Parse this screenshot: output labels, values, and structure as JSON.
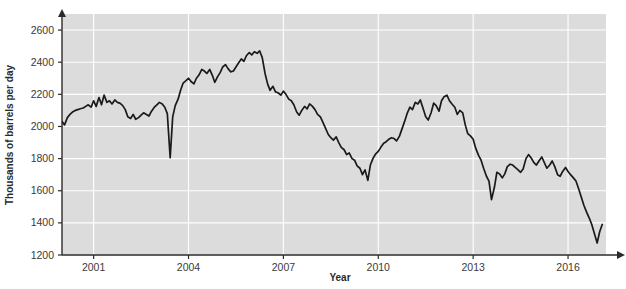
{
  "chart_data": {
    "type": "line",
    "title": "",
    "subtitle": "",
    "xlabel": "Year",
    "ylabel": "Thousands of barrels per day",
    "xlim": [
      2000.0,
      2017.2
    ],
    "ylim": [
      1200,
      2700
    ],
    "y_ticks": [
      1200,
      1400,
      1600,
      1800,
      2000,
      2200,
      2400,
      2600
    ],
    "x_ticks": [
      2001,
      2004,
      2007,
      2010,
      2013,
      2016
    ],
    "grid": "horizontal-and-vertical-white-gridlines",
    "legend": "none",
    "line_color": "#1a1a1a",
    "plot_background": "#dcdcdc",
    "series": [
      {
        "name": "Production",
        "x": [
          2000.0,
          2000.08,
          2000.17,
          2000.25,
          2000.33,
          2000.42,
          2000.5,
          2000.58,
          2000.67,
          2000.75,
          2000.83,
          2000.92,
          2001.0,
          2001.08,
          2001.17,
          2001.25,
          2001.33,
          2001.42,
          2001.5,
          2001.58,
          2001.67,
          2001.75,
          2001.83,
          2001.92,
          2002.0,
          2002.08,
          2002.17,
          2002.25,
          2002.33,
          2002.42,
          2002.5,
          2002.58,
          2002.67,
          2002.75,
          2002.83,
          2002.92,
          2003.0,
          2003.08,
          2003.17,
          2003.25,
          2003.33,
          2003.42,
          2003.5,
          2003.58,
          2003.67,
          2003.75,
          2003.83,
          2003.92,
          2004.0,
          2004.08,
          2004.17,
          2004.25,
          2004.33,
          2004.42,
          2004.5,
          2004.58,
          2004.67,
          2004.75,
          2004.83,
          2004.92,
          2005.0,
          2005.08,
          2005.17,
          2005.25,
          2005.33,
          2005.42,
          2005.5,
          2005.58,
          2005.67,
          2005.75,
          2005.83,
          2005.92,
          2006.0,
          2006.08,
          2006.17,
          2006.25,
          2006.33,
          2006.42,
          2006.5,
          2006.58,
          2006.67,
          2006.75,
          2006.83,
          2006.92,
          2007.0,
          2007.08,
          2007.17,
          2007.25,
          2007.33,
          2007.42,
          2007.5,
          2007.58,
          2007.67,
          2007.75,
          2007.83,
          2007.92,
          2008.0,
          2008.08,
          2008.17,
          2008.25,
          2008.33,
          2008.42,
          2008.5,
          2008.58,
          2008.67,
          2008.75,
          2008.83,
          2008.92,
          2009.0,
          2009.08,
          2009.17,
          2009.25,
          2009.33,
          2009.42,
          2009.5,
          2009.58,
          2009.67,
          2009.75,
          2009.83,
          2009.92,
          2010.0,
          2010.08,
          2010.17,
          2010.25,
          2010.33,
          2010.42,
          2010.5,
          2010.58,
          2010.67,
          2010.75,
          2010.83,
          2010.92,
          2011.0,
          2011.08,
          2011.17,
          2011.25,
          2011.33,
          2011.42,
          2011.5,
          2011.58,
          2011.67,
          2011.75,
          2011.83,
          2011.92,
          2012.0,
          2012.08,
          2012.17,
          2012.25,
          2012.33,
          2012.42,
          2012.5,
          2012.58,
          2012.67,
          2012.75,
          2012.83,
          2012.92,
          2013.0,
          2013.08,
          2013.17,
          2013.25,
          2013.33,
          2013.42,
          2013.5,
          2013.58,
          2013.67,
          2013.75,
          2013.83,
          2013.92,
          2014.0,
          2014.08,
          2014.17,
          2014.25,
          2014.33,
          2014.42,
          2014.5,
          2014.58,
          2014.67,
          2014.75,
          2014.83,
          2014.92,
          2015.0,
          2015.08,
          2015.17,
          2015.25,
          2015.33,
          2015.42,
          2015.5,
          2015.58,
          2015.67,
          2015.75,
          2015.83,
          2015.92,
          2016.0,
          2016.08,
          2016.17,
          2016.25,
          2016.33,
          2016.42,
          2016.5,
          2016.58,
          2016.67,
          2016.75,
          2016.83,
          2016.92,
          2017.0,
          2017.08
        ],
        "values": [
          2030,
          2010,
          2055,
          2075,
          2090,
          2100,
          2105,
          2110,
          2115,
          2125,
          2135,
          2120,
          2160,
          2125,
          2180,
          2135,
          2195,
          2150,
          2160,
          2140,
          2165,
          2150,
          2145,
          2130,
          2105,
          2060,
          2050,
          2075,
          2045,
          2055,
          2070,
          2085,
          2075,
          2065,
          2095,
          2120,
          2135,
          2150,
          2140,
          2120,
          2080,
          1805,
          2060,
          2130,
          2170,
          2225,
          2270,
          2285,
          2300,
          2280,
          2265,
          2300,
          2320,
          2355,
          2345,
          2330,
          2355,
          2320,
          2275,
          2310,
          2335,
          2370,
          2385,
          2360,
          2340,
          2345,
          2370,
          2395,
          2420,
          2405,
          2440,
          2460,
          2445,
          2465,
          2455,
          2470,
          2430,
          2330,
          2265,
          2225,
          2250,
          2215,
          2210,
          2195,
          2220,
          2200,
          2170,
          2160,
          2135,
          2090,
          2070,
          2100,
          2125,
          2110,
          2140,
          2125,
          2105,
          2075,
          2060,
          2025,
          1990,
          1950,
          1930,
          1915,
          1935,
          1900,
          1870,
          1855,
          1825,
          1835,
          1800,
          1790,
          1755,
          1740,
          1700,
          1730,
          1665,
          1760,
          1800,
          1830,
          1845,
          1870,
          1895,
          1905,
          1920,
          1930,
          1925,
          1910,
          1940,
          1985,
          2030,
          2085,
          2120,
          2105,
          2150,
          2140,
          2165,
          2110,
          2060,
          2040,
          2085,
          2145,
          2130,
          2095,
          2160,
          2185,
          2195,
          2160,
          2140,
          2120,
          2075,
          2100,
          2085,
          2010,
          1955,
          1940,
          1920,
          1865,
          1820,
          1790,
          1740,
          1690,
          1660,
          1545,
          1620,
          1715,
          1705,
          1680,
          1705,
          1750,
          1765,
          1760,
          1745,
          1730,
          1715,
          1735,
          1800,
          1825,
          1805,
          1775,
          1760,
          1785,
          1810,
          1775,
          1740,
          1760,
          1785,
          1750,
          1700,
          1690,
          1720,
          1745,
          1720,
          1700,
          1680,
          1660,
          1615,
          1560,
          1510,
          1470,
          1430,
          1390,
          1335,
          1275,
          1345,
          1390
        ]
      }
    ]
  },
  "plot": {
    "left": 62,
    "right": 606,
    "top": 14,
    "bottom": 255,
    "axis_color": "#2b2b2b"
  },
  "axes": {
    "y_tick_labels": [
      "1200",
      "1400",
      "1600",
      "1800",
      "2000",
      "2200",
      "2400",
      "2600"
    ],
    "x_tick_labels": [
      "2001",
      "2004",
      "2007",
      "2010",
      "2013",
      "2016"
    ]
  }
}
